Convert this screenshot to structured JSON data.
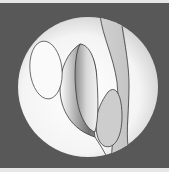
{
  "figure": {
    "colors": {
      "frame": "#e6e6e6",
      "background": "#585858",
      "circle_light": "#ffffff",
      "circle_edge": "#cfcfcf",
      "cavity_dark": "#6e6e6e",
      "line": "#3a3a3a"
    },
    "circle": {
      "cx": 88,
      "cy": 87,
      "r": 70
    },
    "labels": []
  }
}
